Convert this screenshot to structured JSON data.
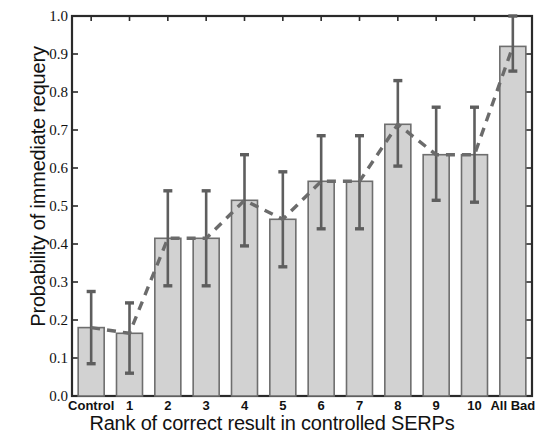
{
  "chart_data": {
    "type": "bar",
    "title": "",
    "xlabel": "Rank of correct result in controlled SERPs",
    "ylabel": "Probability of immediate requery",
    "categories": [
      "Control",
      "1",
      "2",
      "3",
      "4",
      "5",
      "6",
      "7",
      "8",
      "9",
      "10",
      "All Bad"
    ],
    "values": [
      0.18,
      0.165,
      0.415,
      0.415,
      0.515,
      0.465,
      0.565,
      0.565,
      0.715,
      0.635,
      0.635,
      0.92
    ],
    "error_low": [
      0.085,
      0.06,
      0.29,
      0.29,
      0.395,
      0.34,
      0.44,
      0.44,
      0.605,
      0.515,
      0.51,
      0.855
    ],
    "error_high": [
      0.275,
      0.245,
      0.54,
      0.54,
      0.635,
      0.59,
      0.685,
      0.685,
      0.83,
      0.76,
      0.76,
      1.0
    ],
    "ylim": [
      0.0,
      1.0
    ],
    "ytick_labels": [
      "0.0",
      "0.1",
      "0.2",
      "0.3",
      "0.4",
      "0.5",
      "0.6",
      "0.7",
      "0.8",
      "0.9",
      "1.0"
    ],
    "ytick_values": [
      0.0,
      0.1,
      0.2,
      0.3,
      0.4,
      0.5,
      0.6,
      0.7,
      0.8,
      0.9,
      1.0
    ],
    "grid": false,
    "legend": null,
    "series": [
      {
        "name": "Probability of immediate requery",
        "values": [
          0.18,
          0.165,
          0.415,
          0.415,
          0.515,
          0.465,
          0.565,
          0.565,
          0.715,
          0.635,
          0.635,
          0.92
        ]
      }
    ],
    "overlay": {
      "type": "line",
      "style": "dashed",
      "connects": "bar tops",
      "values": [
        0.18,
        0.165,
        0.415,
        0.415,
        0.515,
        0.465,
        0.565,
        0.565,
        0.715,
        0.635,
        0.635,
        0.92
      ]
    },
    "colors": {
      "bar_fill": "#d2d2d2",
      "bar_edge": "#6e6e6e",
      "error_bar": "#5e5e5e",
      "dashed_line": "#6b6b6b",
      "axis": "#2a2a2a",
      "text": "#111111"
    }
  }
}
